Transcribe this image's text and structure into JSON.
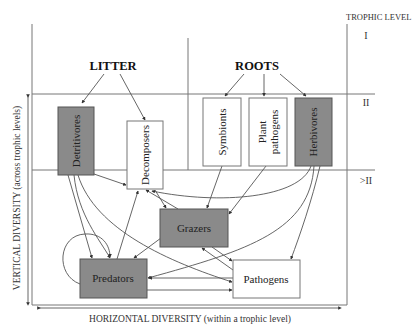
{
  "diagram": {
    "trophic_header": "TROPHIC LEVEL",
    "levels": [
      "I",
      "II",
      ">II"
    ],
    "sources": {
      "litter": "LITTER",
      "roots": "ROOTS"
    },
    "nodes": {
      "detritivores": {
        "label": "Detritivores",
        "shade": "dark"
      },
      "decomposers": {
        "label": "Decomposers",
        "shade": "light"
      },
      "symbionts": {
        "label": "Symbionts",
        "shade": "light"
      },
      "plant_pathogens": {
        "label_line1": "Plant",
        "label_line2": "pathogens",
        "shade": "light"
      },
      "herbivores": {
        "label": "Herbivores",
        "shade": "dark"
      },
      "grazers": {
        "label": "Grazers",
        "shade": "dark"
      },
      "predators": {
        "label": "Predators",
        "shade": "dark"
      },
      "pathogens": {
        "label": "Pathogens",
        "shade": "light"
      }
    },
    "axes": {
      "vertical": "VERTICAL DIVERSITY (across trophic levels)",
      "horizontal": "HORIZONTAL DIVERSITY (within a trophic level)"
    },
    "edges": [
      {
        "from": "LITTER",
        "to": "Detritivores"
      },
      {
        "from": "LITTER",
        "to": "Decomposers"
      },
      {
        "from": "ROOTS",
        "to": "Symbionts"
      },
      {
        "from": "ROOTS",
        "to": "Plant pathogens"
      },
      {
        "from": "ROOTS",
        "to": "Herbivores"
      },
      {
        "from": "Detritivores",
        "to": "Decomposers"
      },
      {
        "from": "Detritivores",
        "to": "Predators"
      },
      {
        "from": "Detritivores",
        "to": "Pathogens"
      },
      {
        "from": "Symbionts",
        "to": "Grazers"
      },
      {
        "from": "Plant pathogens",
        "to": "Grazers"
      },
      {
        "from": "Herbivores",
        "to": "Decomposers"
      },
      {
        "from": "Herbivores",
        "to": "Predators"
      },
      {
        "from": "Herbivores",
        "to": "Pathogens"
      },
      {
        "from": "Grazers",
        "to": "Decomposers"
      },
      {
        "from": "Decomposers",
        "to": "Grazers"
      },
      {
        "from": "Grazers",
        "to": "Predators"
      },
      {
        "from": "Pathogens",
        "to": "Grazers"
      },
      {
        "from": "Grazers",
        "to": "Pathogens"
      },
      {
        "from": "Predators",
        "to": "Decomposers"
      },
      {
        "from": "Predators",
        "to": "Predators"
      },
      {
        "from": "Predators",
        "to": "Pathogens"
      },
      {
        "from": "Pathogens",
        "to": "Predators"
      }
    ],
    "colors": {
      "dark_box": "#8a8a8a",
      "light_box": "#ffffff",
      "line": "#555555"
    }
  }
}
